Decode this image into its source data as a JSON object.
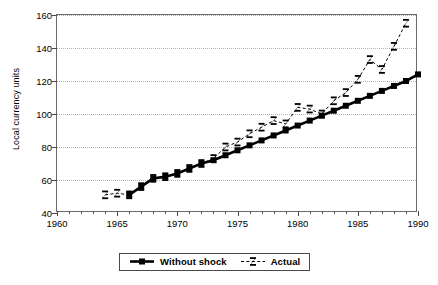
{
  "chart_data": {
    "type": "line",
    "title": "",
    "xlabel": "",
    "ylabel": "Local currency units",
    "xlim": [
      1960,
      1990
    ],
    "ylim": [
      40,
      160
    ],
    "ytick_values": [
      40,
      60,
      80,
      100,
      120,
      140,
      160
    ],
    "ytick_labels": [
      "40",
      "60",
      "80",
      "100",
      "120",
      "140",
      "160"
    ],
    "xtick_values": [
      1960,
      1965,
      1970,
      1975,
      1980,
      1985,
      1990
    ],
    "xtick_labels": [
      "1960",
      "1965",
      "1970",
      "1975",
      "1980",
      "1985",
      "1990"
    ],
    "xtick_minor_step": 1,
    "grid": "horizontal-dotted",
    "legend_position": "below-center",
    "series": [
      {
        "name": "Without shock",
        "marker": "filled-square",
        "linestyle": "solid",
        "color": "#000000",
        "x": [
          1966,
          1967,
          1968,
          1969,
          1970,
          1971,
          1972,
          1973,
          1974,
          1975,
          1976,
          1977,
          1978,
          1979,
          1980,
          1981,
          1982,
          1983,
          1984,
          1985,
          1986,
          1987,
          1988,
          1989,
          1990
        ],
        "y": [
          51,
          56,
          61,
          62,
          64,
          67,
          70,
          72,
          75,
          78,
          81,
          84,
          87,
          90,
          93,
          96,
          99,
          102,
          105,
          108,
          111,
          114,
          117,
          120,
          124
        ]
      },
      {
        "name": "Actual",
        "marker": "bowtie",
        "linestyle": "dashed",
        "color": "#000000",
        "x": [
          1964,
          1965,
          1966,
          1967,
          1968,
          1969,
          1970,
          1971,
          1972,
          1973,
          1974,
          1975,
          1976,
          1977,
          1978,
          1979,
          1980,
          1981,
          1982,
          1983,
          1984,
          1985,
          1986,
          1987,
          1988,
          1989
        ],
        "y": [
          51,
          52,
          51,
          56,
          61,
          62,
          64,
          67,
          70,
          73,
          80,
          83,
          88,
          92,
          96,
          94,
          104,
          103,
          100,
          108,
          113,
          121,
          133,
          127,
          141,
          155
        ]
      }
    ]
  },
  "legend": {
    "entries": [
      {
        "label": "Without shock",
        "marker": "filled-square",
        "style": "solid"
      },
      {
        "label": "Actual",
        "marker": "bowtie",
        "style": "dashed"
      }
    ]
  }
}
